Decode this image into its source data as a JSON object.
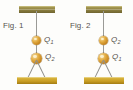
{
  "figure": {
    "background_color": "#fdfdfb",
    "ceiling_bar_color": "#8d8040",
    "floor_bar_color": "#c79c22",
    "sphere_color": "#e0a83c",
    "string_color": "#9a9a96",
    "label_color": "#56524c"
  },
  "panels": [
    {
      "caption": "Fig. 1",
      "upper_charge": {
        "symbol": "Q",
        "subscript": "1",
        "full": "Q1"
      },
      "lower_charge": {
        "symbol": "Q",
        "subscript": "2",
        "full": "Q2"
      }
    },
    {
      "caption": "Fig. 2",
      "upper_charge": {
        "symbol": "Q",
        "subscript": "2",
        "full": "Q2"
      },
      "lower_charge": {
        "symbol": "Q",
        "subscript": "1",
        "full": "Q1"
      }
    }
  ]
}
